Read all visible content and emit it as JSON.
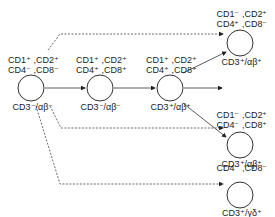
{
  "diagram": {
    "nodes": [
      {
        "id": "n1",
        "markers_line1": "CD1⁺ ,CD2⁺",
        "markers_line2": "CD4⁻ ,CD8⁻",
        "receptor": "CD3⁻/αβ⁻"
      },
      {
        "id": "n2",
        "markers_line1": "CD1⁺ ,CD2⁺",
        "markers_line2": "CD4⁺ ,CD8⁺",
        "receptor": "CD3⁻/αβ⁻"
      },
      {
        "id": "n3",
        "markers_line1": "CD1⁺ ,CD2⁺",
        "markers_line2": "CD4⁺ ,CD8⁺",
        "receptor": "CD3⁺/αβ⁺"
      },
      {
        "id": "n4",
        "markers_line1": "CD1⁻ ,CD2⁺",
        "markers_line2": "CD4⁺ ,CD8⁻",
        "receptor": "CD3⁺/αβ⁺"
      },
      {
        "id": "n5",
        "markers_line1": "CD1⁻ ,CD2⁺",
        "markers_line2": "CD4⁻ ,CD8⁺",
        "receptor": "CD3⁺/αβ⁺"
      },
      {
        "id": "n6",
        "markers_line1": "CD1⁻ ,CD2⁺",
        "markers_line2": "CD4⁻ ,CD8⁻",
        "receptor": "CD3⁺/γδ⁺"
      }
    ],
    "edges": [
      {
        "from": "n1",
        "to": "n2",
        "style": "solid"
      },
      {
        "from": "n2",
        "to": "n3",
        "style": "solid"
      },
      {
        "from": "n3",
        "to": "n4",
        "style": "solid"
      },
      {
        "from": "n3",
        "to": "n5",
        "style": "solid"
      },
      {
        "from": "n3",
        "to": "right",
        "style": "solid"
      },
      {
        "from": "n1",
        "to": "n4",
        "style": "dashed"
      },
      {
        "from": "n1",
        "to": "n5",
        "style": "dashed"
      },
      {
        "from": "n1",
        "to": "n6",
        "style": "dashed"
      }
    ]
  }
}
